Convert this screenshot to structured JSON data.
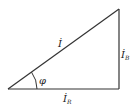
{
  "diagram": {
    "type": "phasor-triangle",
    "colors": {
      "stroke": "#333333",
      "text": "#222222",
      "background": "#ffffff"
    },
    "labels": {
      "hypotenuse": {
        "main": "İ",
        "sub": ""
      },
      "vertical": {
        "main": "İ",
        "sub": "B"
      },
      "horizontal": {
        "main": "İ",
        "sub": "R"
      },
      "angle": "φ"
    }
  }
}
